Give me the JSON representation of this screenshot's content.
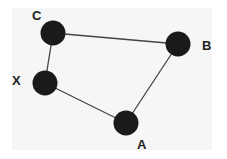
{
  "diagram": {
    "type": "graph",
    "colors": {
      "node": "#1a1a1a",
      "edge": "#444444",
      "label": "#222222",
      "background": "#f6f6f6"
    },
    "nodes": [
      {
        "id": "C",
        "label": "C",
        "cx": 53,
        "cy": 33,
        "lx": 32,
        "ly": 20
      },
      {
        "id": "B",
        "label": "B",
        "cx": 178,
        "cy": 44,
        "lx": 202,
        "ly": 50
      },
      {
        "id": "X",
        "label": "X",
        "cx": 45,
        "cy": 83,
        "lx": 12,
        "ly": 85
      },
      {
        "id": "A",
        "label": "A",
        "cx": 126,
        "cy": 123,
        "lx": 137,
        "ly": 149
      }
    ],
    "edges": [
      {
        "from": "C",
        "to": "B"
      },
      {
        "from": "B",
        "to": "A"
      },
      {
        "from": "A",
        "to": "X"
      },
      {
        "from": "X",
        "to": "C"
      }
    ]
  }
}
